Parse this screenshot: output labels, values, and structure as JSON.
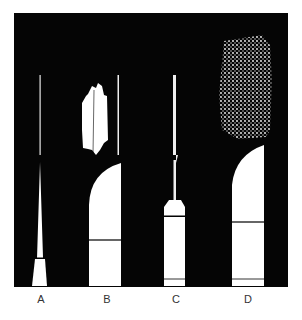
{
  "figure": {
    "background": "#ffffff",
    "panel_color": "#050505",
    "foreground": "#ffffff",
    "panels": [
      {
        "label": "A",
        "description": "thin rod with tapered base, no emission"
      },
      {
        "label": "B",
        "description": "arched electrode with rod, streaky white emission"
      },
      {
        "label": "C",
        "description": "needle electrode with collar, no emission"
      },
      {
        "label": "D",
        "description": "arched electrode, speckled diffuse emission"
      }
    ]
  }
}
